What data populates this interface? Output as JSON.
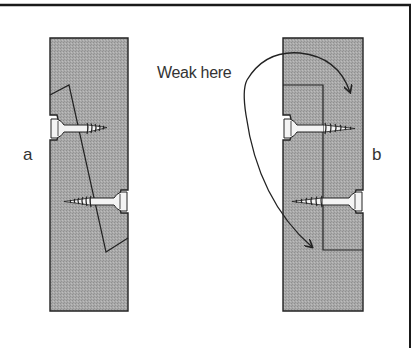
{
  "figure": {
    "callout": "Weak here",
    "panels": [
      {
        "id": "a",
        "label": "a",
        "description": "Joint with angled (scarf) cut, two screws"
      },
      {
        "id": "b",
        "label": "b",
        "description": "Joint with stepped (L-shaped) cut, two screws"
      }
    ]
  },
  "colors": {
    "wood_fill": "#a6a6a6",
    "outline": "#222222",
    "screw_fill": "#f4f4f4",
    "frame": "#1a1a1a",
    "background": "#ffffff"
  }
}
